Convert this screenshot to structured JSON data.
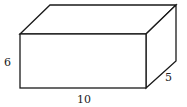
{
  "diagram": {
    "dimensions": {
      "height": "6",
      "length": "10",
      "depth": "5"
    },
    "labels": [
      {
        "id": "height",
        "text": "6"
      },
      {
        "id": "length",
        "text": "10"
      },
      {
        "id": "depth",
        "text": "5"
      }
    ],
    "colors": {
      "stroke": "#1a1a1a",
      "fill": "#ffffff"
    }
  }
}
